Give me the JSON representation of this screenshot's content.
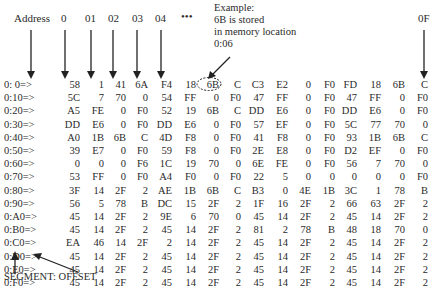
{
  "example_note": {
    "lines": [
      "Example:",
      "6B is stored",
      "in memory location",
      "0:06"
    ]
  },
  "header": {
    "address_label": "Address",
    "columns": [
      "0",
      "01",
      "02",
      "03",
      "04",
      "•••",
      "0F"
    ]
  },
  "footer_label": "SEGMENT: OFFSET",
  "highlight": {
    "row": 0,
    "col": 6,
    "value": "6B"
  },
  "memory_dump": {
    "rows": [
      {
        "addr": "0: 0=>",
        "bytes": [
          "58",
          "1",
          "41",
          "6A",
          "F4",
          "18",
          "6B",
          "C",
          "C3",
          "E2",
          "0",
          "F0",
          "FD",
          "18",
          "6B",
          "C"
        ]
      },
      {
        "addr": "0:10=>",
        "bytes": [
          "5C",
          "7",
          "70",
          "0",
          "54",
          "FF",
          "0",
          "F0",
          "47",
          "FF",
          "0",
          "F0",
          "47",
          "FF",
          "0",
          "F0"
        ]
      },
      {
        "addr": "0:20=>",
        "bytes": [
          "A5",
          "FE",
          "0",
          "F0",
          "52",
          "19",
          "6B",
          "C",
          "DD",
          "E6",
          "0",
          "F0",
          "DD",
          "E6",
          "0",
          "F0"
        ]
      },
      {
        "addr": "0:30=>",
        "bytes": [
          "DD",
          "E6",
          "0",
          "F0",
          "DD",
          "E6",
          "0",
          "F0",
          "57",
          "EF",
          "0",
          "F0",
          "5C",
          "77",
          "70",
          "0"
        ]
      },
      {
        "addr": "0:40=>",
        "bytes": [
          "A0",
          "1B",
          "6B",
          "C",
          "4D",
          "F8",
          "0",
          "F0",
          "41",
          "F8",
          "0",
          "F0",
          "93",
          "1B",
          "6B",
          "C"
        ]
      },
      {
        "addr": "0:50=>",
        "bytes": [
          "39",
          "E7",
          "0",
          "F0",
          "59",
          "F8",
          "0",
          "F0",
          "2E",
          "E8",
          "0",
          "F0",
          "D2",
          "EF",
          "0",
          "F0"
        ]
      },
      {
        "addr": "0:60=>",
        "bytes": [
          "0",
          "0",
          "0",
          "F6",
          "1C",
          "19",
          "70",
          "0",
          "6E",
          "FE",
          "0",
          "F0",
          "56",
          "7",
          "70",
          "0"
        ]
      },
      {
        "addr": "0:70=>",
        "bytes": [
          "53",
          "FF",
          "0",
          "F0",
          "A4",
          "F0",
          "0",
          "F0",
          "22",
          "5",
          "0",
          "0",
          "0",
          "0",
          "0",
          "F0"
        ]
      },
      {
        "addr": "0:80=>",
        "bytes": [
          "3F",
          "14",
          "2F",
          "2",
          "AE",
          "1B",
          "6B",
          "C",
          "B3",
          "0",
          "4E",
          "1B",
          "3C",
          "1",
          "78",
          "B"
        ]
      },
      {
        "addr": "0:90=>",
        "bytes": [
          "56",
          "5",
          "78",
          "B",
          "DC",
          "15",
          "2F",
          "2",
          "1F",
          "16",
          "2F",
          "2",
          "66",
          "63",
          "2F",
          "2"
        ]
      },
      {
        "addr": "0:A0=>",
        "bytes": [
          "45",
          "14",
          "2F",
          "2",
          "9E",
          "6",
          "70",
          "0",
          "45",
          "14",
          "2F",
          "2",
          "45",
          "14",
          "2F",
          "2"
        ]
      },
      {
        "addr": "0:B0=>",
        "bytes": [
          "45",
          "14",
          "2F",
          "2",
          "45",
          "14",
          "2F",
          "2",
          "81",
          "2",
          "78",
          "B",
          "48",
          "18",
          "70",
          "0"
        ]
      },
      {
        "addr": "0:C0=>",
        "bytes": [
          "EA",
          "46",
          "14",
          "2F",
          "2",
          "14",
          "2F",
          "2",
          "45",
          "14",
          "2F",
          "2",
          "45",
          "14",
          "2F",
          "2"
        ]
      },
      {
        "addr": "0:D0=>",
        "bytes": [
          "45",
          "14",
          "2F",
          "2",
          "45",
          "14",
          "2F",
          "2",
          "45",
          "14",
          "2F",
          "2",
          "45",
          "14",
          "2F",
          "2"
        ]
      },
      {
        "addr": "0:E0=>",
        "bytes": [
          "45",
          "14",
          "2F",
          "2",
          "45",
          "14",
          "2F",
          "2",
          "45",
          "14",
          "2F",
          "2",
          "45",
          "14",
          "2F",
          "2"
        ]
      },
      {
        "addr": "0:F0=>",
        "bytes": [
          "45",
          "14",
          "2F",
          "2",
          "45",
          "14",
          "2F",
          "2",
          "45",
          "14",
          "2F",
          "2",
          "45",
          "14",
          "2F",
          "2"
        ]
      }
    ]
  }
}
